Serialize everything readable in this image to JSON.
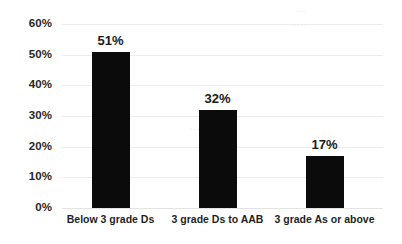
{
  "chart_data": {
    "type": "bar",
    "title": "",
    "xlabel": "",
    "ylabel": "",
    "categories": [
      "Below 3 grade Ds",
      "3 grade Ds to AAB",
      "3 grade As or above"
    ],
    "values": [
      51,
      32,
      17
    ],
    "value_labels": [
      "51%",
      "32%",
      "17%"
    ],
    "ylim": [
      0,
      60
    ],
    "ytick_values": [
      0,
      10,
      20,
      30,
      40,
      50,
      60
    ],
    "ytick_labels": [
      "0%",
      "10%",
      "20%",
      "30%",
      "40%",
      "50%",
      "60%"
    ],
    "grid": true,
    "legend": "none",
    "bar_color": "#0b0b0b",
    "gridline_color": "#ededed",
    "background_color": "#ffffff",
    "label_color": "#262626"
  },
  "watermark": {
    "a": "...",
    "b": ".....",
    "c": "....",
    "d": "..."
  }
}
